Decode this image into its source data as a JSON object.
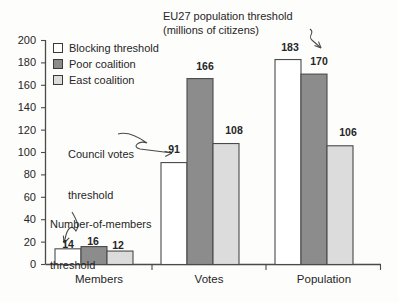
{
  "chart_data": {
    "type": "bar",
    "title": "EU27 population threshold (millions of citizens)",
    "title_line1": "EU27 population threshold",
    "title_line2": "(millions of citizens)",
    "xlabel": "",
    "ylabel": "",
    "ylim": [
      0,
      200
    ],
    "ytick_step": 20,
    "yticks": [
      200,
      180,
      160,
      140,
      120,
      100,
      80,
      60,
      40,
      20,
      0
    ],
    "grid": false,
    "legend_position": "top-left",
    "categories": [
      "Members",
      "Votes",
      "Population"
    ],
    "series": [
      {
        "name": "Blocking threshold",
        "color": "#ffffff",
        "values": [
          14,
          91,
          183
        ]
      },
      {
        "name": "Poor coalition",
        "color": "#8c8c8c",
        "values": [
          16,
          166,
          170
        ]
      },
      {
        "name": "East coalition",
        "color": "#dcdcdc",
        "values": [
          12,
          108,
          106
        ]
      }
    ],
    "annotations": [
      {
        "id": "population-threshold",
        "text": "EU27 population threshold (millions of citizens)",
        "points_to": 183
      },
      {
        "id": "council-votes-threshold",
        "line1": "Council votes",
        "line2": "threshold",
        "points_to": 91
      },
      {
        "id": "number-of-members-threshold",
        "line1": "Number-of-members",
        "line2": "threshold",
        "points_to": 14
      }
    ]
  },
  "legend": {
    "items": [
      {
        "label": "Blocking threshold"
      },
      {
        "label": "Poor coalition"
      },
      {
        "label": "East coalition"
      }
    ]
  },
  "axis": {
    "y_labels": [
      "200",
      "180",
      "160",
      "140",
      "120",
      "100",
      "80",
      "60",
      "40",
      "20",
      "0"
    ],
    "x_labels": [
      "Members",
      "Votes",
      "Population"
    ]
  },
  "value_labels": {
    "members": [
      "14",
      "16",
      "12"
    ],
    "votes": [
      "91",
      "166",
      "108"
    ],
    "population": [
      "183",
      "170",
      "106"
    ]
  },
  "annotations": {
    "title_line1": "EU27 population threshold",
    "title_line2": "(millions of citizens)",
    "council_line1": "Council votes",
    "council_line2": "threshold",
    "members_line1": "Number-of-members",
    "members_line2": "threshold"
  }
}
